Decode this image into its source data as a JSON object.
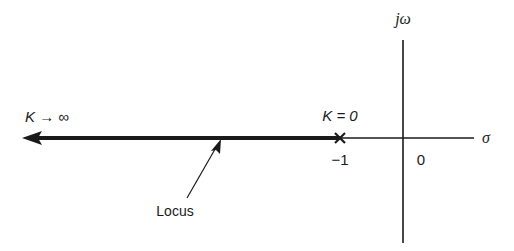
{
  "diagram": {
    "type": "root-locus",
    "axes": {
      "real_axis_label": "σ",
      "imag_axis_label": "jω",
      "origin_label": "0"
    },
    "pole": {
      "marker": "×",
      "location_label": "−1",
      "gain_label": "K = 0"
    },
    "locus": {
      "direction_label": "K → ∞",
      "annotation": "Locus"
    },
    "colors": {
      "line": "#1a1a1a",
      "background": "#ffffff"
    }
  }
}
